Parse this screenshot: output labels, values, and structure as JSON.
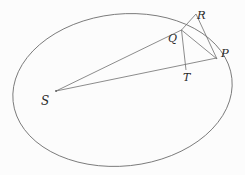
{
  "figure": {
    "type": "geometry-diagram",
    "background_color": "#fcfcfc",
    "stroke_color": "#5a5a5a",
    "label_color": "#2a2a2a",
    "width": 245,
    "height": 175
  },
  "labels": {
    "S": "S",
    "Q": "Q",
    "R": "R",
    "T": "T",
    "P": "P"
  },
  "geometry": {
    "ellipse": {
      "cx": 122.5,
      "cy": 90,
      "rx": 110,
      "ry": 76,
      "rotation_deg": -6
    },
    "points": {
      "S": {
        "x": 56,
        "y": 91
      },
      "Q": {
        "x": 181,
        "y": 30
      },
      "R": {
        "x": 196,
        "y": 14
      },
      "T": {
        "x": 186,
        "y": 70
      },
      "P": {
        "x": 216,
        "y": 58
      }
    },
    "segments": [
      {
        "name": "S-Q",
        "from": "S",
        "to": "Q"
      },
      {
        "name": "S-P",
        "from": "S",
        "to": "P"
      },
      {
        "name": "Q-T",
        "from": "Q",
        "to": "T"
      },
      {
        "name": "Q-R",
        "from": "Q",
        "to": "R"
      },
      {
        "name": "R-P",
        "from": "R",
        "to": "P"
      },
      {
        "name": "Q-P",
        "from": "Q",
        "to": "P"
      }
    ]
  }
}
